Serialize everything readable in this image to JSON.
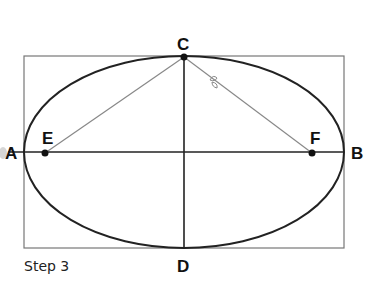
{
  "diagram": {
    "caption": "Step 3",
    "points": {
      "A": "A",
      "B": "B",
      "C": "C",
      "D": "D",
      "E": "E",
      "F": "F"
    }
  }
}
